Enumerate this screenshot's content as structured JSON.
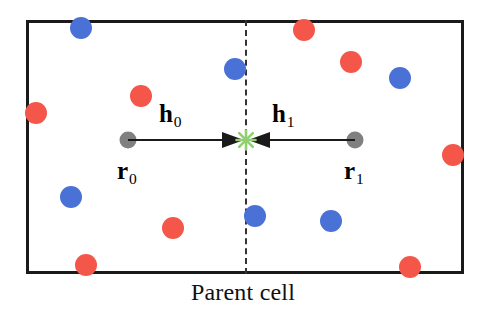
{
  "figure": {
    "caption": "Parent cell",
    "cell": {
      "x": 26,
      "y": 20,
      "width": 438,
      "height": 254,
      "border_color": "#1a1a1a",
      "background": "#ffffff"
    },
    "midline": {
      "name": "cell-bisector",
      "x": 246,
      "style": "dashed",
      "color": "#333333"
    }
  },
  "vectors": {
    "h0": {
      "label": "h",
      "subscript": "0"
    },
    "h1": {
      "label": "h",
      "subscript": "1"
    },
    "line": {
      "x1": 128,
      "x2": 355,
      "y": 140,
      "color": "#1a1a1a"
    },
    "meeting_point": {
      "x": 246,
      "y": 140,
      "color": "#90d070"
    }
  },
  "positions": {
    "r0": {
      "label": "r",
      "subscript": "0",
      "x": 128,
      "y": 140,
      "color": "#808080"
    },
    "r1": {
      "label": "r",
      "subscript": "1",
      "x": 355,
      "y": 140,
      "color": "#808080"
    }
  },
  "colors": {
    "red": "#f4564a",
    "blue": "#4a72d6",
    "gray": "#808080",
    "green": "#90d070",
    "border": "#1a1a1a"
  },
  "particles": [
    {
      "color": "blue",
      "x": 81,
      "y": 28,
      "r": 11
    },
    {
      "color": "red",
      "x": 304,
      "y": 30,
      "r": 11
    },
    {
      "color": "red",
      "x": 351,
      "y": 62,
      "r": 11
    },
    {
      "color": "blue",
      "x": 235,
      "y": 69,
      "r": 11
    },
    {
      "color": "blue",
      "x": 400,
      "y": 78,
      "r": 11
    },
    {
      "color": "red",
      "x": 141,
      "y": 96,
      "r": 11
    },
    {
      "color": "red",
      "x": 36,
      "y": 113,
      "r": 11
    },
    {
      "color": "red",
      "x": 453,
      "y": 155,
      "r": 11
    },
    {
      "color": "blue",
      "x": 71,
      "y": 197,
      "r": 11
    },
    {
      "color": "blue",
      "x": 255,
      "y": 216,
      "r": 11
    },
    {
      "color": "blue",
      "x": 331,
      "y": 221,
      "r": 11
    },
    {
      "color": "red",
      "x": 173,
      "y": 228,
      "r": 11
    },
    {
      "color": "red",
      "x": 86,
      "y": 265,
      "r": 11
    },
    {
      "color": "red",
      "x": 410,
      "y": 267,
      "r": 11
    }
  ],
  "chart_data": {
    "type": "scatter",
    "title": "Parent cell",
    "xlabel": "",
    "ylabel": "",
    "xlim": [
      26,
      464
    ],
    "ylim": [
      20,
      274
    ],
    "grid": false,
    "legend": null,
    "annotations": [
      "h0",
      "h1",
      "r0",
      "r1",
      "Parent cell"
    ],
    "series": [
      {
        "name": "red particles",
        "color": "#f4564a",
        "points": [
          [
            304,
            30
          ],
          [
            351,
            62
          ],
          [
            141,
            96
          ],
          [
            36,
            113
          ],
          [
            453,
            155
          ],
          [
            173,
            228
          ],
          [
            86,
            265
          ],
          [
            410,
            267
          ]
        ]
      },
      {
        "name": "blue particles",
        "color": "#4a72d6",
        "points": [
          [
            81,
            28
          ],
          [
            235,
            69
          ],
          [
            400,
            78
          ],
          [
            71,
            197
          ],
          [
            255,
            216
          ],
          [
            331,
            221
          ]
        ]
      },
      {
        "name": "reference positions",
        "color": "#808080",
        "points": [
          [
            128,
            140
          ],
          [
            355,
            140
          ]
        ]
      },
      {
        "name": "image point",
        "color": "#90d070",
        "points": [
          [
            246,
            140
          ]
        ]
      }
    ]
  }
}
